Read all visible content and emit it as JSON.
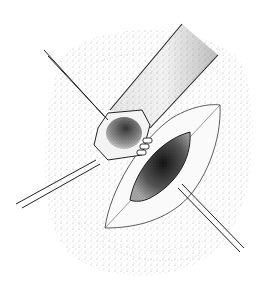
{
  "figure": {
    "type": "stipple surgical illustration",
    "caption": "",
    "elements": [
      {
        "name": "surrounding-tissue",
        "desc": "stippled contoured skin field"
      },
      {
        "name": "tubular-vessel",
        "desc": "large diagonal tubular structure"
      },
      {
        "name": "retracted-stump",
        "desc": "cut end with sutures"
      },
      {
        "name": "incision-opening",
        "desc": "dark elliptical opening in leaf-shaped flap"
      },
      {
        "name": "traction-sutures",
        "desc": "two long suture threads"
      }
    ],
    "colors": {
      "background": "#ffffff",
      "ink": "#1a1a1a",
      "stipple": "#555555"
    }
  }
}
